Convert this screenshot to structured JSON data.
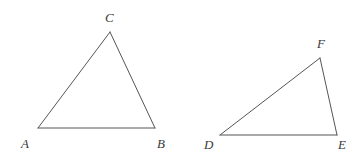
{
  "figure": {
    "background_color": "#ffffff",
    "stroke_color": "#555555",
    "stroke_width": 1,
    "label_color": "#3a3a3a",
    "width": 364,
    "height": 163,
    "triangles": [
      {
        "name": "triangle-abc",
        "vertices": [
          {
            "label": "A",
            "x": 38,
            "y": 128,
            "label_x": 21,
            "label_y": 137
          },
          {
            "label": "B",
            "x": 155,
            "y": 128,
            "label_x": 157,
            "label_y": 137
          },
          {
            "label": "C",
            "x": 110,
            "y": 32,
            "label_x": 105,
            "label_y": 11
          }
        ],
        "edges": [
          {
            "name": "side-AB",
            "from": "A",
            "to": "B"
          },
          {
            "name": "side-BC",
            "from": "B",
            "to": "C"
          },
          {
            "name": "side-CA",
            "from": "C",
            "to": "A"
          }
        ]
      },
      {
        "name": "triangle-def",
        "vertices": [
          {
            "label": "D",
            "x": 220,
            "y": 135,
            "label_x": 204,
            "label_y": 138
          },
          {
            "label": "E",
            "x": 337,
            "y": 135,
            "label_x": 338,
            "label_y": 138
          },
          {
            "label": "F",
            "x": 320,
            "y": 58,
            "label_x": 317,
            "label_y": 37
          }
        ],
        "edges": [
          {
            "name": "side-DE",
            "from": "D",
            "to": "E"
          },
          {
            "name": "side-EF",
            "from": "E",
            "to": "F"
          },
          {
            "name": "side-FD",
            "from": "F",
            "to": "D"
          }
        ]
      }
    ]
  }
}
